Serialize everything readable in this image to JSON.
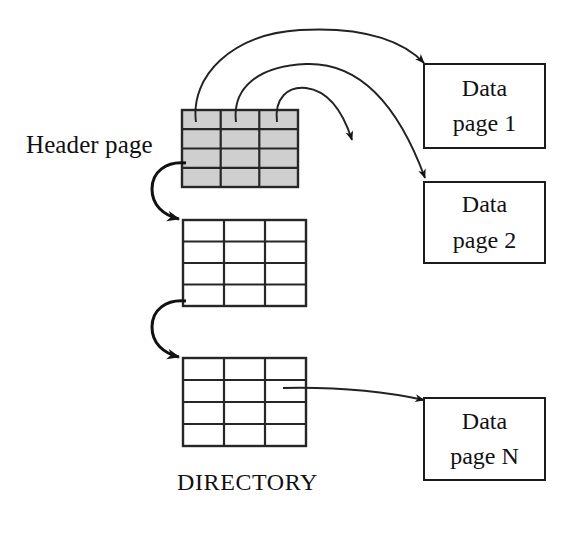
{
  "figure": {
    "kind": "diagram",
    "background_color": "#ffffff",
    "line_color": "#1b1b1b",
    "header_fill_color": "#cccccc"
  },
  "labels": {
    "header_page": "Header page",
    "directory": "DIRECTORY"
  },
  "directory_pages": [
    {
      "id": "header-page",
      "name": "Header page",
      "shaded": true,
      "rows": 4,
      "cols": 3,
      "x": 182,
      "y": 110,
      "width": 116,
      "height": 77
    },
    {
      "id": "directory-page-2",
      "name": "Directory page 2",
      "shaded": false,
      "rows": 4,
      "cols": 3,
      "x": 183,
      "y": 220,
      "width": 123,
      "height": 86
    },
    {
      "id": "directory-page-3",
      "name": "Directory page 3",
      "shaded": false,
      "rows": 4,
      "cols": 3,
      "x": 183,
      "y": 358,
      "width": 123,
      "height": 88
    }
  ],
  "data_pages": [
    {
      "id": "data-page-1",
      "line1": "Data",
      "line2": "page 1"
    },
    {
      "id": "data-page-2",
      "line1": "Data",
      "line2": "page 2"
    },
    {
      "id": "data-page-n",
      "line1": "Data",
      "line2": "page N"
    }
  ],
  "connectors": [
    {
      "id": "header-cell-1-to-data-page-1",
      "from": "header page cell 1",
      "to": "Data page 1",
      "style": "curved-arrow"
    },
    {
      "id": "header-cell-2-to-data-page-2",
      "from": "header page cell 2",
      "to": "Data page 2",
      "style": "curved-arrow"
    },
    {
      "id": "header-cell-3-to-free-space",
      "from": "header page cell 3",
      "to": "unlabeled data page",
      "style": "curved-arrow"
    },
    {
      "id": "header-page-to-directory-page-2",
      "from": "Header page",
      "to": "Directory page 2",
      "style": "curved-arrow"
    },
    {
      "id": "directory-page-2-to-directory-page-3",
      "from": "Directory page 2",
      "to": "Directory page 3",
      "style": "curved-arrow"
    },
    {
      "id": "directory-page-3-to-data-page-n",
      "from": "Directory page 3",
      "to": "Data page N",
      "style": "curved-arrow"
    }
  ]
}
